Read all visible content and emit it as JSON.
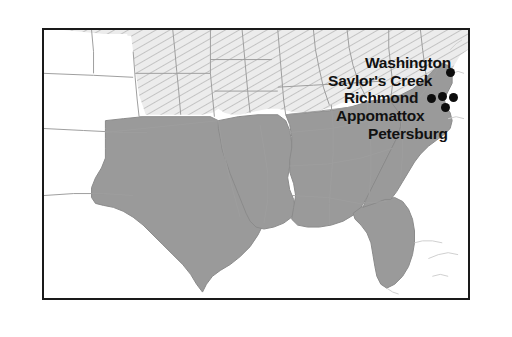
{
  "figure": {
    "kind": "historical-map",
    "background_color": "#ffffff",
    "frame_color": "#1a1a1a"
  },
  "legend_colors": {
    "confederate_fill": "#9a9a9a",
    "union_hatch_fill": "#e8e8e8",
    "union_hatch_line": "#b4b4b4",
    "territory_fill": "#ffffff",
    "border_line": "#8c8c8c",
    "coast_line": "#c8c8c8",
    "dot_color": "#0d0d0d",
    "label_color": "#111111"
  },
  "labels": [
    {
      "text": "Washington",
      "x": 365,
      "y": 55
    },
    {
      "text": "Saylor's Creek",
      "x": 328,
      "y": 73
    },
    {
      "text": "Richmond",
      "x": 344,
      "y": 90
    },
    {
      "text": "Appomattox",
      "x": 336,
      "y": 108
    },
    {
      "text": "Petersburg",
      "x": 368,
      "y": 126
    }
  ],
  "dots": [
    {
      "name": "washington-dot",
      "x": 446,
      "y": 68
    },
    {
      "name": "saylors-creek-dot",
      "x": 438,
      "y": 92
    },
    {
      "name": "richmond-dot",
      "x": 449,
      "y": 93
    },
    {
      "name": "appomattox-dot",
      "x": 427,
      "y": 94
    },
    {
      "name": "petersburg-dot",
      "x": 441,
      "y": 103
    }
  ]
}
